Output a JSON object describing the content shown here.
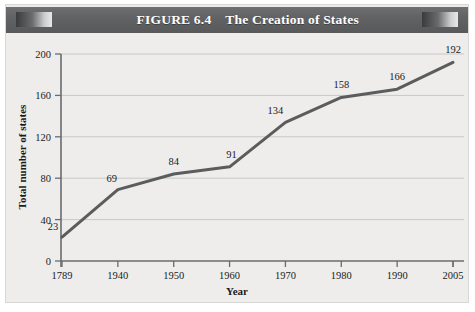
{
  "figure": {
    "number_label": "FIGURE 6.4",
    "title": "The Creation of States"
  },
  "chart_data": {
    "type": "line",
    "title": "The Creation of States",
    "xlabel": "Year",
    "ylabel": "Total number of states",
    "categories": [
      "1789",
      "1940",
      "1950",
      "1960",
      "1970",
      "1980",
      "1990",
      "2005"
    ],
    "values": [
      23,
      69,
      84,
      91,
      134,
      158,
      166,
      192
    ],
    "point_labels": [
      "23",
      "69",
      "84",
      "91",
      "134",
      "158",
      "166",
      "192"
    ],
    "ylim": [
      0,
      200
    ],
    "yticks": [
      0,
      40,
      80,
      120,
      160,
      200
    ],
    "ytick_labels": [
      "0",
      "40",
      "80",
      "120",
      "160",
      "200"
    ],
    "xtick_labels": [
      "1789",
      "1940",
      "1950",
      "1960",
      "1970",
      "1980",
      "1990",
      "2005"
    ],
    "grid": "horizontal",
    "legend": "none",
    "line_color": "#5b5c5e",
    "grid_color": "#c9c8c6",
    "axis_color": "#6a6b6d",
    "plot_background": "#eeedeb",
    "banner_color": "#616264"
  }
}
